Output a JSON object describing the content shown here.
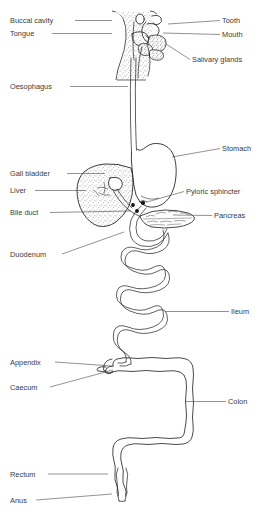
{
  "figure": {
    "type": "anatomical-line-diagram",
    "background_color": "#ffffff",
    "line_color": "#1c1c1c",
    "text_color": "#3a3a3a",
    "stipple_color": "#555555"
  },
  "labels": {
    "left": [
      {
        "id": "buccal-cavity",
        "text": "Buccal cavity",
        "text_x": 10,
        "text_y": 23,
        "leader": "M 75 20.5 L 112 20.5"
      },
      {
        "id": "tongue",
        "text": "Tongue",
        "text_x": 10,
        "text_y": 36,
        "leader": "M 52 33.5 L 112 33.5"
      },
      {
        "id": "oesophagus",
        "text": "Oesophagus",
        "text_x": 10,
        "text_y": 89,
        "leader": "M 70 86.5 L 128 86.5"
      },
      {
        "id": "gall-bladder",
        "text": "Gall bladder",
        "text_x": 10,
        "text_y": 176,
        "leader": "M 67 173.5 L 105 173.5"
      },
      {
        "id": "liver",
        "text": "Liver",
        "text_x": 10,
        "text_y": 193,
        "leader": "M 35 190.5 L 86 190.5"
      },
      {
        "id": "bile-duct",
        "text": "Bile duct",
        "text_x": 10,
        "text_y": 215,
        "leader": "M 50 212.5 L 131 211"
      },
      {
        "id": "duodenum",
        "text": "Duodenum",
        "text_x": 10,
        "text_y": 257,
        "leader": "M 62 254 L 124 232"
      },
      {
        "id": "appendix",
        "text": "Appendix",
        "text_x": 10,
        "text_y": 365,
        "leader": "M 55 362 L 112 366"
      },
      {
        "id": "caecum",
        "text": "Caecum",
        "text_x": 10,
        "text_y": 390,
        "leader": "M 50 387 L 113 370"
      },
      {
        "id": "rectum",
        "text": "Rectum",
        "text_x": 10,
        "text_y": 477,
        "leader": "M 48 474 L 108 474"
      },
      {
        "id": "anus",
        "text": "Anus",
        "text_x": 10,
        "text_y": 503,
        "leader": "M 36 500 L 112 494"
      }
    ],
    "right": [
      {
        "id": "tooth",
        "text": "Tooth",
        "text_x": 222,
        "text_y": 23,
        "leader": "M 220 20.5 L 168 24"
      },
      {
        "id": "mouth",
        "text": "Mouth",
        "text_x": 222,
        "text_y": 37,
        "leader": "M 220 34.5 L 163 33"
      },
      {
        "id": "salivary-glands",
        "text": "Salivary glands",
        "text_x": 192,
        "text_y": 62,
        "leader": "M 190 59.5 L 166 44"
      },
      {
        "id": "stomach",
        "text": "Stomach",
        "text_x": 222,
        "text_y": 151,
        "leader": "M 220 148.5 L 172 157"
      },
      {
        "id": "pyloric-sphincter",
        "text": "Pyloric sphincter",
        "text_x": 186,
        "text_y": 194,
        "leader": "M 184 191.5 L 147 202"
      },
      {
        "id": "pancreas",
        "text": "Pancreas",
        "text_x": 214,
        "text_y": 218,
        "leader": "M 212 215.5 L 173 215"
      },
      {
        "id": "ileum",
        "text": "Ileum",
        "text_x": 231,
        "text_y": 314,
        "leader": "M 229 311.5 L 165 311.5"
      },
      {
        "id": "colon",
        "text": "Colon",
        "text_x": 228,
        "text_y": 404,
        "leader": "M 226 401.5 L 185 401.5"
      }
    ]
  },
  "organs": {
    "head_profile": "Stippled head and neck outline in profile",
    "oesophagus": "Long narrow double-line tube",
    "stomach": "J-shaped sac",
    "liver": "Stippled wedge-shaped lobe",
    "gall_bladder": "Small pear-shaped sac on liver",
    "pancreas": "Lobed feathery elongated gland",
    "duodenum": "C-shaped loop below stomach",
    "ileum": "Serpentine coiled tube, seven switchbacks",
    "caecum": "Pouch at start of colon",
    "appendix": "Small finger-like projection",
    "colon": "Inverted-U with scalloped haustra",
    "rectum": "Narrowing terminal segment",
    "anus": "Small terminal opening"
  }
}
